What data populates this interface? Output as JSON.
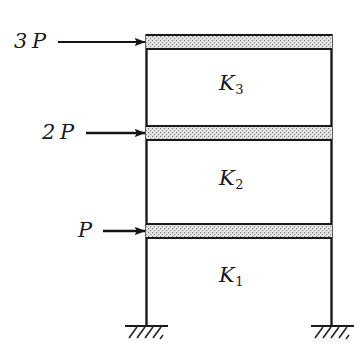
{
  "figure": {
    "type": "structural-frame-diagram",
    "background_color": "#ffffff",
    "line_color": "#1a1a1a",
    "slab_fill_color": "#f0f0f0",
    "stipple_color": "#8a8a8a"
  },
  "loads": [
    {
      "id": "load-top",
      "label": "3 P",
      "coefficient": "3",
      "symbol": "P",
      "level": "roof",
      "direction": "right",
      "arrow": {
        "x1": 58,
        "y1": 42,
        "x2": 145,
        "y2": 42
      },
      "label_pos": {
        "x": 14,
        "y": 31
      }
    },
    {
      "id": "load-middle",
      "label": "2 P",
      "coefficient": "2",
      "symbol": "P",
      "level": "second-floor",
      "direction": "right",
      "arrow": {
        "x1": 86,
        "y1": 133,
        "x2": 145,
        "y2": 133
      },
      "label_pos": {
        "x": 42,
        "y": 122
      }
    },
    {
      "id": "load-bottom",
      "label": "P",
      "coefficient": "",
      "symbol": "P",
      "level": "first-floor",
      "direction": "right",
      "arrow": {
        "x1": 103,
        "y1": 231,
        "x2": 145,
        "y2": 231
      },
      "label_pos": {
        "x": 78,
        "y": 220
      }
    }
  ],
  "stories": [
    {
      "id": "story-3",
      "label": "K",
      "subscript": "3",
      "full_label": "K3",
      "label_pos": {
        "x": 219,
        "y": 73
      }
    },
    {
      "id": "story-2",
      "label": "K",
      "subscript": "2",
      "full_label": "K2",
      "label_pos": {
        "x": 219,
        "y": 168
      }
    },
    {
      "id": "story-1",
      "label": "K",
      "subscript": "1",
      "full_label": "K1",
      "label_pos": {
        "x": 219,
        "y": 265
      }
    }
  ],
  "geometry": {
    "left_column_x": 146,
    "right_column_x": 332,
    "columns": [
      {
        "id": "column-left",
        "x": 146,
        "y_top": 34,
        "y_bottom": 326
      },
      {
        "id": "column-right",
        "x": 332,
        "y_top": 34,
        "y_bottom": 326
      }
    ],
    "beams": [
      {
        "id": "beam-roof",
        "x": 146,
        "y": 34,
        "width": 186,
        "height": 16
      },
      {
        "id": "beam-level2",
        "x": 146,
        "y": 125,
        "width": 186,
        "height": 16
      },
      {
        "id": "beam-level1",
        "x": 146,
        "y": 223,
        "width": 186,
        "height": 16
      }
    ],
    "supports": [
      {
        "id": "support-left",
        "x": 146,
        "y": 326,
        "type": "fixed"
      },
      {
        "id": "support-right",
        "x": 332,
        "y": 326,
        "type": "fixed"
      }
    ]
  }
}
